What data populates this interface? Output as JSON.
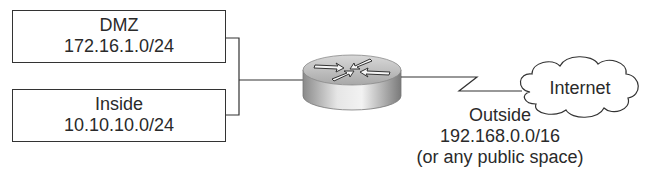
{
  "diagram": {
    "type": "network-topology",
    "nodes": {
      "dmz": {
        "name": "DMZ",
        "subnet": "172.16.1.0/24"
      },
      "inside": {
        "name": "Inside",
        "subnet": "10.10.10.0/24"
      },
      "router": {
        "icon": "router-icon"
      },
      "internet": {
        "name": "Internet",
        "icon": "cloud-icon"
      }
    },
    "links": {
      "outside": {
        "name": "Outside",
        "subnet": "192.168.0.0/16",
        "note": "(or any public space)",
        "style": "serial-zigzag"
      }
    }
  }
}
